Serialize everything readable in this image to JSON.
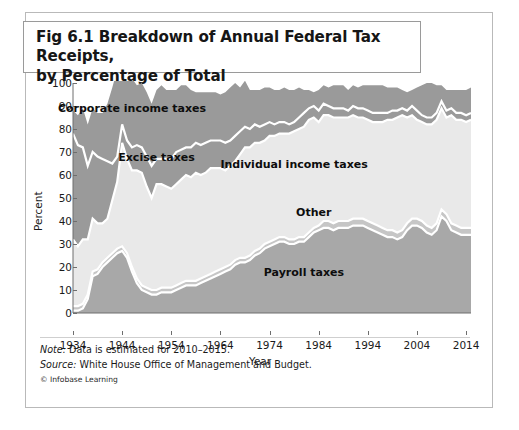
{
  "title": {
    "line1": "Fig 6.1 Breakdown of Annual Federal Tax Receipts,",
    "line2": "by Percentage of Total"
  },
  "notes": {
    "note_label": "Note:",
    "note_text": " Data is estimated for 2010–2015.",
    "source_label": "Source:",
    "source_text": " White House Office of Management and Budget.",
    "copyright": "© Infobase Learning"
  },
  "colors": {
    "corporate": "#9a9a9a",
    "excise": "#9a9a9a",
    "individual": "#e9e9e9",
    "other": "#c6c6c6",
    "payroll": "#a8a8a8",
    "separator": "#ffffff",
    "axis": "#6e6e6e",
    "text": "#1a1a1a",
    "frame": "#b9b9b9"
  },
  "chart_data": {
    "type": "area",
    "stacked": true,
    "title": "Fig 6.1 Breakdown of Annual Federal Tax Receipts, by Percentage of Total",
    "xlabel": "Year",
    "ylabel": "Percent",
    "xlim": [
      1934,
      2015
    ],
    "ylim": [
      0,
      100
    ],
    "ytick_values": [
      0,
      10,
      20,
      30,
      40,
      50,
      60,
      70,
      80,
      90,
      100
    ],
    "xtick_values": [
      1934,
      1944,
      1954,
      1964,
      1974,
      1984,
      1994,
      2004,
      2014
    ],
    "grid": false,
    "legend_position": "inline-annotations",
    "annotations": [
      {
        "text": "Corporate income taxes",
        "x": 1946,
        "y": 89
      },
      {
        "text": "Excise taxes",
        "x": 1951,
        "y": 68
      },
      {
        "text": "Individual income taxes",
        "x": 1979,
        "y": 65
      },
      {
        "text": "Other",
        "x": 1983,
        "y": 44
      },
      {
        "text": "Payroll taxes",
        "x": 1981,
        "y": 18
      }
    ],
    "x": [
      1934,
      1935,
      1936,
      1937,
      1938,
      1939,
      1940,
      1941,
      1942,
      1943,
      1944,
      1945,
      1946,
      1947,
      1948,
      1949,
      1950,
      1951,
      1952,
      1953,
      1954,
      1955,
      1956,
      1957,
      1958,
      1959,
      1960,
      1961,
      1962,
      1963,
      1964,
      1965,
      1966,
      1967,
      1968,
      1969,
      1970,
      1971,
      1972,
      1973,
      1974,
      1975,
      1976,
      1977,
      1978,
      1979,
      1980,
      1981,
      1982,
      1983,
      1984,
      1985,
      1986,
      1987,
      1988,
      1989,
      1990,
      1991,
      1992,
      1993,
      1994,
      1995,
      1996,
      1997,
      1998,
      1999,
      2000,
      2001,
      2002,
      2003,
      2004,
      2005,
      2006,
      2007,
      2008,
      2009,
      2010,
      2011,
      2012,
      2013,
      2014,
      2015
    ],
    "series": [
      {
        "name": "Payroll taxes",
        "values": [
          1,
          1,
          2,
          6,
          16,
          17,
          20,
          22,
          24,
          26,
          27,
          24,
          18,
          13,
          10,
          9,
          8,
          8,
          9,
          9,
          9,
          10,
          11,
          12,
          12,
          12,
          13,
          14,
          15,
          16,
          17,
          18,
          19,
          21,
          22,
          22,
          23,
          25,
          26,
          28,
          29,
          30,
          31,
          31,
          30,
          30,
          31,
          31,
          33,
          35,
          36,
          37,
          37,
          36,
          37,
          37,
          37,
          38,
          38,
          38,
          37,
          36,
          35,
          34,
          33,
          33,
          32,
          33,
          36,
          38,
          38,
          37,
          35,
          34,
          36,
          42,
          40,
          36,
          35,
          34,
          34,
          34
        ]
      },
      {
        "name": "Other",
        "values": [
          2,
          2,
          2,
          2,
          2,
          2,
          2,
          2,
          2,
          2,
          2,
          2,
          2,
          2,
          2,
          2,
          2,
          2,
          2,
          2,
          2,
          2,
          2,
          2,
          2,
          2,
          2,
          2,
          2,
          2,
          2,
          2,
          2,
          2,
          2,
          2,
          2,
          2,
          2,
          2,
          2,
          2,
          2,
          2,
          2,
          2,
          2,
          2,
          2,
          2,
          2,
          3,
          3,
          3,
          3,
          3,
          3,
          3,
          3,
          3,
          3,
          3,
          3,
          3,
          3,
          3,
          3,
          3,
          3,
          3,
          3,
          3,
          3,
          3,
          3,
          3,
          3,
          3,
          3,
          3,
          3,
          3
        ]
      },
      {
        "name": "Individual income taxes",
        "values": [
          29,
          26,
          28,
          24,
          23,
          20,
          17,
          17,
          23,
          29,
          45,
          41,
          42,
          47,
          49,
          44,
          40,
          46,
          45,
          44,
          43,
          44,
          45,
          46,
          45,
          47,
          45,
          45,
          46,
          45,
          44,
          42,
          43,
          43,
          45,
          48,
          47,
          47,
          46,
          45,
          46,
          45,
          45,
          45,
          46,
          47,
          47,
          48,
          49,
          48,
          45,
          46,
          46,
          46,
          45,
          45,
          45,
          45,
          44,
          44,
          44,
          44,
          45,
          46,
          48,
          48,
          50,
          50,
          46,
          45,
          43,
          43,
          44,
          45,
          45,
          44,
          42,
          47,
          46,
          47,
          46,
          47
        ]
      },
      {
        "name": "Excise taxes",
        "values": [
          46,
          44,
          40,
          32,
          29,
          29,
          28,
          25,
          16,
          11,
          8,
          8,
          10,
          11,
          11,
          13,
          14,
          11,
          11,
          12,
          13,
          14,
          13,
          12,
          13,
          13,
          13,
          13,
          12,
          12,
          12,
          12,
          11,
          11,
          10,
          9,
          8,
          8,
          7,
          7,
          6,
          5,
          5,
          5,
          4,
          4,
          5,
          6,
          5,
          5,
          5,
          5,
          4,
          4,
          4,
          4,
          3,
          4,
          4,
          4,
          4,
          4,
          4,
          4,
          3,
          4,
          3,
          3,
          3,
          4,
          4,
          3,
          3,
          3,
          3,
          3,
          3,
          3,
          3,
          3,
          3,
          3
        ]
      },
      {
        "name": "Corporate income taxes",
        "values": [
          10,
          13,
          17,
          18,
          19,
          19,
          20,
          25,
          33,
          38,
          34,
          32,
          30,
          26,
          28,
          28,
          27,
          30,
          32,
          30,
          30,
          27,
          28,
          27,
          25,
          22,
          23,
          22,
          21,
          21,
          20,
          22,
          23,
          23,
          19,
          20,
          17,
          15,
          16,
          16,
          15,
          15,
          14,
          15,
          15,
          14,
          13,
          10,
          8,
          6,
          9,
          8,
          8,
          10,
          10,
          10,
          9,
          9,
          9,
          10,
          11,
          12,
          12,
          12,
          11,
          10,
          10,
          8,
          8,
          7,
          10,
          13,
          15,
          15,
          12,
          7,
          9,
          8,
          10,
          10,
          11,
          11
        ]
      }
    ]
  }
}
